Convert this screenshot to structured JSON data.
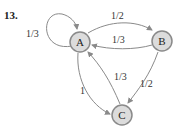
{
  "problem_number": "13.",
  "nodes": [
    {
      "id": "A",
      "label": "A"
    },
    {
      "id": "B",
      "label": "B"
    },
    {
      "id": "C",
      "label": "C"
    }
  ],
  "edges": [
    {
      "from": "A",
      "to": "A",
      "label": "1/3"
    },
    {
      "from": "A",
      "to": "B",
      "label": "1/2"
    },
    {
      "from": "B",
      "to": "A",
      "label": "1/3"
    },
    {
      "from": "C",
      "to": "A",
      "label": "1/3"
    },
    {
      "from": "A",
      "to": "C",
      "label": "1"
    },
    {
      "from": "B",
      "to": "C",
      "label": "1/2"
    }
  ],
  "colors": {
    "node_fill": "#dcdcdc",
    "node_stroke": "#8a8a8a",
    "edge": "#8a8a8a"
  }
}
